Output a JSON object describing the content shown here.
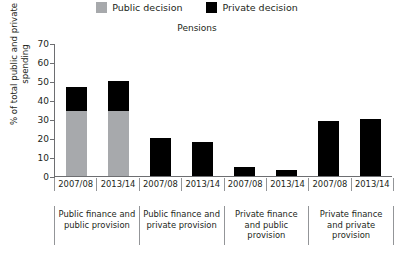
{
  "legend": {
    "entries": [
      {
        "label": "Public decision",
        "color": "#a7a9ac",
        "key": "public"
      },
      {
        "label": "Private decision",
        "color": "#000000",
        "key": "private"
      }
    ]
  },
  "chart_data": {
    "type": "bar",
    "subtype": "stacked",
    "title": "Pensions",
    "xlabel": "",
    "ylabel": "% of total public and private spending",
    "ylim": [
      0,
      70
    ],
    "yticks": [
      0,
      10,
      20,
      30,
      40,
      50,
      60,
      70
    ],
    "grid": false,
    "legend_position": "top",
    "categories": [
      "2007/08",
      "2013/14",
      "2007/08",
      "2013/14",
      "2007/08",
      "2013/14",
      "2007/08",
      "2013/14"
    ],
    "groups": [
      {
        "label": "Public finance and public provision",
        "categories": [
          "2007/08",
          "2013/14"
        ]
      },
      {
        "label": "Public finance and private provision",
        "categories": [
          "2007/08",
          "2013/14"
        ]
      },
      {
        "label": "Private finance and public provision",
        "categories": [
          "2007/08",
          "2013/14"
        ]
      },
      {
        "label": "Private finance and private provision",
        "categories": [
          "2007/08",
          "2013/14"
        ]
      }
    ],
    "series": [
      {
        "name": "Public decision",
        "color": "#a7a9ac",
        "values": [
          34,
          34,
          0,
          0,
          0,
          0,
          0,
          0
        ]
      },
      {
        "name": "Private decision",
        "color": "#000000",
        "values": [
          13,
          16,
          20,
          18,
          5,
          3,
          29,
          30
        ]
      }
    ],
    "totals": [
      47,
      50,
      20,
      18,
      5,
      3,
      29,
      30
    ]
  }
}
